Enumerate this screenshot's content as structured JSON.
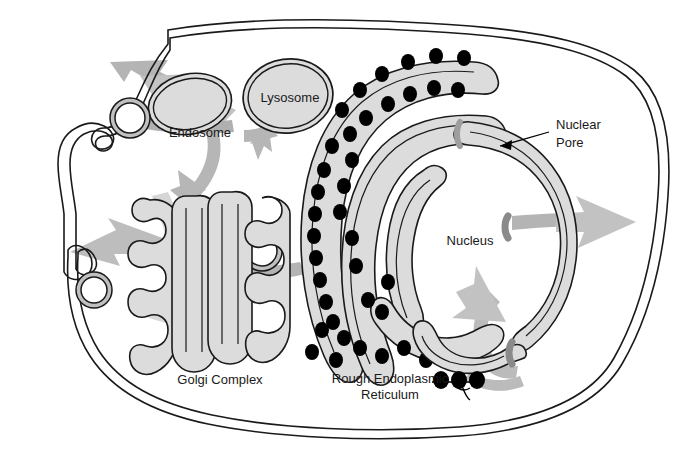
{
  "figure": {
    "background_color": "#ffffff",
    "outline_color": "#1a1a1a",
    "organelle_fill": "#d9d9d9",
    "arrow_color": "#a9a9a9",
    "ribosome_color": "#000000",
    "pore_color": "#9a9a9a"
  },
  "labels": {
    "lysosome": "Lysosome",
    "endosome": "Endosome",
    "nuclear_pore_line1": "Nuclear",
    "nuclear_pore_line2": "Pore",
    "nucleus": "Nucleus",
    "golgi": "Golgi Complex",
    "rough_er_line1": "Rough Endoplasmic",
    "rough_er_line2": "Reticulum"
  },
  "structures": {
    "plasma_membrane": "plasma-membrane",
    "nuclear_envelope": "nuclear-envelope",
    "nuclear_pores": 3,
    "golgi_cisternae": 5,
    "transport_vesicles": 4,
    "er_cisternae": 4,
    "ribosome_count": 38,
    "mrna_ribosomes": 3,
    "transport_arrows": 8
  },
  "footer": {
    "cut_text": ""
  }
}
